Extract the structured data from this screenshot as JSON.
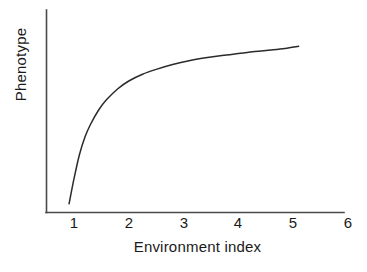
{
  "chart_data": {
    "type": "line",
    "title": "",
    "xlabel": "Environment index",
    "ylabel": "Phenotype",
    "xlim": [
      0.55,
      6.35
    ],
    "ylim": [
      0,
      1
    ],
    "grid": false,
    "legend": null,
    "x_ticks": [
      "1",
      "2",
      "3",
      "4",
      "5",
      "6"
    ],
    "x_tick_values": [
      1,
      2,
      3,
      4,
      5,
      6
    ],
    "y_ticks": [],
    "axis_color": "#4a4a4a",
    "curve_color": "#2b2b2b",
    "background": "#ffffff",
    "series": [
      {
        "name": "reaction norm",
        "description": "saturating (diminishing-returns) response of phenotype to environment index",
        "x": [
          0.91,
          1.0,
          1.1,
          1.2,
          1.3,
          1.45,
          1.6,
          1.8,
          2.0,
          2.25,
          2.5,
          2.8,
          3.1,
          3.4,
          3.7,
          4.0,
          4.3,
          4.6,
          4.85,
          5.1
        ],
        "y": [
          0.045,
          0.175,
          0.3,
          0.39,
          0.455,
          0.53,
          0.585,
          0.64,
          0.68,
          0.715,
          0.74,
          0.765,
          0.785,
          0.8,
          0.812,
          0.822,
          0.832,
          0.84,
          0.848,
          0.86
        ]
      }
    ]
  },
  "axis": {
    "x_tick_1": "1",
    "x_tick_2": "2",
    "x_tick_3": "3",
    "x_tick_4": "4",
    "x_tick_5": "5",
    "x_tick_6": "6"
  },
  "labels": {
    "x_axis_title": "Environment index",
    "y_axis_title": "Phenotype"
  }
}
